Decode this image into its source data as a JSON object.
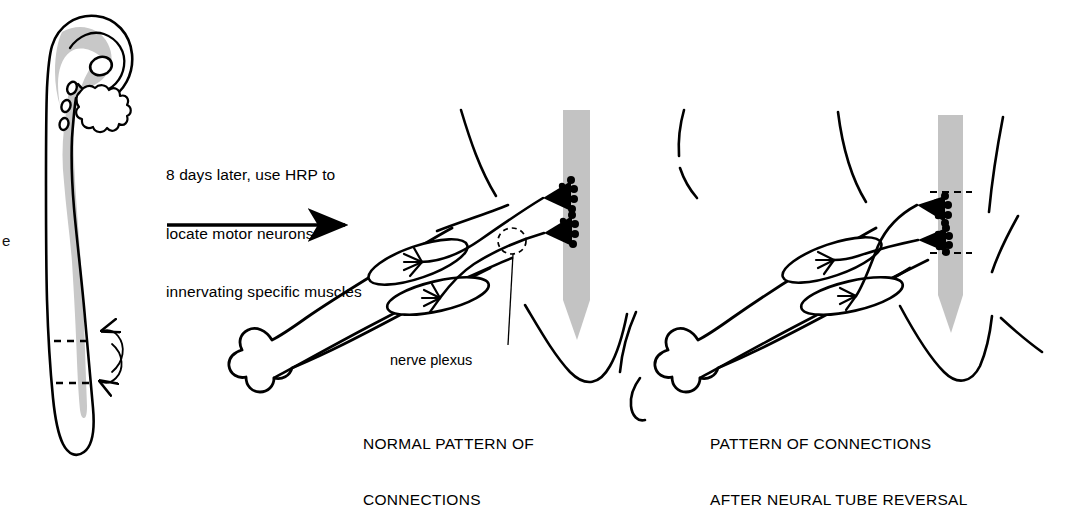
{
  "figure": {
    "background_color": "#ffffff",
    "ink_color": "#000000",
    "neural_tube_gray": "#c3c3c3",
    "embryo_gray": "#c8c8c8"
  },
  "annotation": {
    "line1": "8 days later, use HRP to",
    "line2": "locate motor neurons",
    "line3": "innervating specific muscles",
    "arrow": "rightwards-arrow"
  },
  "labels": {
    "nerve_plexus": "nerve plexus",
    "clipped_left_text": "e"
  },
  "captions": {
    "left_line1": "NORMAL PATTERN OF",
    "left_line2": "CONNECTIONS",
    "right_line1": "PATTERN OF CONNECTIONS",
    "right_line2": "AFTER NEURAL TUBE REVERSAL"
  },
  "panels": {
    "embryo": {
      "name": "chick-embryo-whole-mount",
      "features": [
        "head",
        "eye",
        "brain",
        "branchial-arches",
        "somites",
        "neural-tube",
        "tail"
      ],
      "reversal_marks": [
        "dashed-line-upper",
        "dashed-line-lower",
        "curved-double-arrow"
      ]
    },
    "normal": {
      "name": "normal-limb-innervation",
      "features": [
        "limb-bud",
        "muscle-dorsal",
        "muscle-ventral",
        "nerve-plexus",
        "motor-neuron-pool-upper",
        "motor-neuron-pool-lower",
        "neural-tube",
        "body-wall"
      ]
    },
    "reversed": {
      "name": "reversed-limb-innervation",
      "features": [
        "limb-bud",
        "muscle-dorsal",
        "muscle-ventral",
        "crossed-nerves",
        "motor-neuron-pool-upper",
        "motor-neuron-pool-lower",
        "neural-tube-reversed-segment",
        "dashed-boundary-upper",
        "dashed-boundary-lower",
        "body-wall"
      ]
    }
  }
}
